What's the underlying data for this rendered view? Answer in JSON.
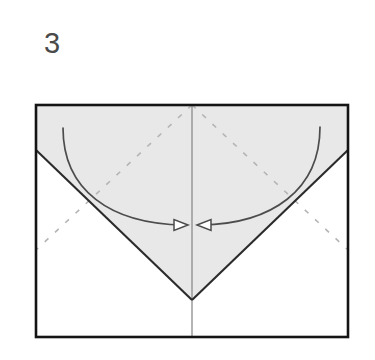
{
  "figure": {
    "kind": "origami-fold-diagram",
    "step_label": "3"
  },
  "colors": {
    "paper_fill": "#ffffff",
    "flap_fill": "#e8e8e8",
    "outline": "#141414",
    "fold_edge": "#2b2b2b",
    "center_line": "#8c8c8c",
    "dashed_crease": "#b4b4b4",
    "arrow_stroke": "#4c4c4c",
    "step_number": "#4a4a4a",
    "background": "#ffffff"
  },
  "geometry": {
    "sheet": {
      "x": 36,
      "y": 105,
      "width": 312,
      "height": 232
    },
    "center_line_x": 192,
    "flap_left_edge_y": 150,
    "flap_right_edge_y": 150,
    "apex": {
      "x": 192,
      "y": 300
    },
    "top_center": {
      "x": 192,
      "y": 105
    },
    "flap_polygon": "36,105 348,105 348,150 192,300 36,150",
    "fold_edge_left": {
      "x1": 36,
      "y1": 150,
      "x2": 192,
      "y2": 300
    },
    "fold_edge_right": {
      "x1": 348,
      "y1": 150,
      "x2": 192,
      "y2": 300
    },
    "dashed_crease_left": {
      "x1": 192,
      "y1": 105,
      "x2": 36,
      "y2": 250
    },
    "dashed_crease_right": {
      "x1": 192,
      "y1": 105,
      "x2": 348,
      "y2": 250
    },
    "dash_pattern": "5 9"
  },
  "arrows": [
    {
      "name": "fold-left-flap-arrow",
      "direction": "right",
      "path": "M 63 128 C 63 190, 110 224, 184 225",
      "tip": {
        "x": 188,
        "y": 225
      },
      "head_points": "188,225 174,219 174,231",
      "label": "Fold left flap to center"
    },
    {
      "name": "fold-right-flap-arrow",
      "direction": "left",
      "path": "M 320 127 C 320 190, 272 224, 201 225",
      "tip": {
        "x": 197,
        "y": 225
      },
      "head_points": "197,225 211,219 211,231",
      "label": "Fold right flap to center"
    }
  ]
}
